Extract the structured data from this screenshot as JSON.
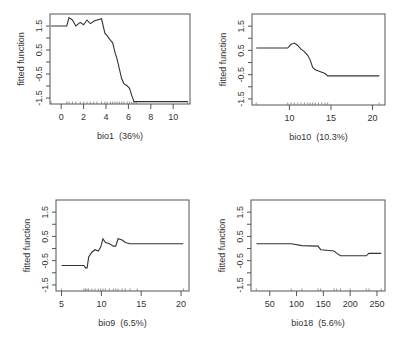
{
  "chart_data": [
    {
      "type": "line",
      "title": "",
      "xlabel": "bio1  (36%)",
      "ylabel": "fitted function",
      "xlim": [
        -1,
        11.5
      ],
      "ylim": [
        -1.75,
        2.0
      ],
      "xticks": [
        0,
        2,
        4,
        6,
        8,
        10
      ],
      "yticks": [
        -1.5,
        -0.5,
        0.5,
        1.5
      ],
      "grid": false,
      "x": [
        -0.9,
        0.5,
        0.7,
        1.0,
        1.3,
        1.7,
        2.0,
        2.3,
        2.6,
        2.9,
        3.2,
        3.6,
        3.9,
        4.1,
        4.4,
        4.6,
        4.8,
        5.0,
        5.2,
        5.4,
        5.6,
        5.9,
        6.1,
        6.3,
        6.5,
        6.7,
        11.3
      ],
      "y": [
        1.5,
        1.5,
        1.85,
        1.75,
        1.5,
        1.65,
        1.55,
        1.75,
        1.6,
        1.7,
        1.75,
        1.8,
        1.2,
        1.1,
        0.9,
        0.8,
        0.4,
        0.1,
        -0.3,
        -0.7,
        -0.9,
        -1.0,
        -1.1,
        -1.4,
        -1.65,
        -1.65,
        -1.65
      ]
    },
    {
      "type": "line",
      "title": "",
      "xlabel": "bio10  (10.3%)",
      "ylabel": "fitted function",
      "xlim": [
        5.5,
        21.5
      ],
      "ylim": [
        -1.75,
        2.0
      ],
      "xticks": [
        10,
        15,
        20
      ],
      "yticks": [
        -1.5,
        -0.5,
        0.5,
        1.5
      ],
      "grid": false,
      "x": [
        6.0,
        9.8,
        10.2,
        10.6,
        11.0,
        11.4,
        11.8,
        12.2,
        12.5,
        12.8,
        13.1,
        13.5,
        13.9,
        14.3,
        14.6,
        20.8
      ],
      "y": [
        0.6,
        0.6,
        0.75,
        0.8,
        0.7,
        0.55,
        0.45,
        0.3,
        0.1,
        -0.2,
        -0.3,
        -0.35,
        -0.4,
        -0.45,
        -0.55,
        -0.55
      ]
    },
    {
      "type": "line",
      "title": "",
      "xlabel": "bio9  (6.5%)",
      "ylabel": "fitted function",
      "xlim": [
        4.3,
        21.0
      ],
      "ylim": [
        -1.75,
        2.0
      ],
      "xticks": [
        5,
        10,
        15,
        20
      ],
      "yticks": [
        -1.5,
        -0.5,
        0.5,
        1.5
      ],
      "grid": false,
      "x": [
        5.0,
        7.8,
        8.0,
        8.2,
        8.4,
        8.8,
        9.2,
        9.6,
        9.9,
        10.2,
        10.5,
        11.0,
        11.5,
        11.8,
        12.1,
        12.6,
        13.0,
        13.6,
        14.5,
        20.3
      ],
      "y": [
        -0.7,
        -0.7,
        -0.8,
        -0.8,
        -0.35,
        -0.15,
        -0.05,
        -0.1,
        0.05,
        0.4,
        0.25,
        0.2,
        0.1,
        0.1,
        0.4,
        0.35,
        0.25,
        0.2,
        0.2,
        0.2
      ]
    },
    {
      "type": "line",
      "title": "",
      "xlabel": "bio18  (5.6%)",
      "ylabel": "fitted function",
      "xlim": [
        15,
        265
      ],
      "ylim": [
        -1.75,
        2.0
      ],
      "xticks": [
        50,
        100,
        150,
        200,
        250
      ],
      "yticks": [
        -1.5,
        -0.5,
        0.5,
        1.5
      ],
      "grid": false,
      "x": [
        25,
        90,
        110,
        140,
        145,
        170,
        175,
        182,
        200,
        230,
        235,
        258
      ],
      "y": [
        0.2,
        0.2,
        0.12,
        0.1,
        -0.05,
        -0.1,
        -0.2,
        -0.3,
        -0.3,
        -0.3,
        -0.2,
        -0.2
      ]
    }
  ]
}
